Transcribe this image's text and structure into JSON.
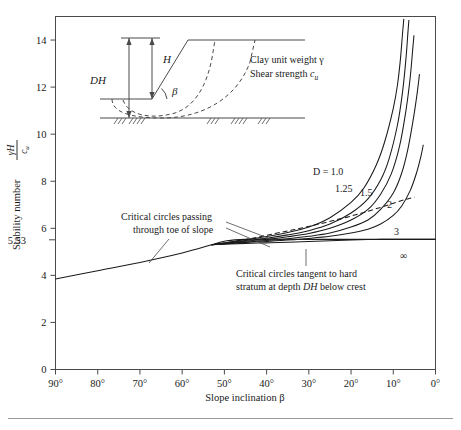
{
  "figure": {
    "domain": "chart",
    "background": "#ffffff",
    "line_color": "#1a1a1a",
    "axis_color": "#4a4a4a"
  },
  "chart_data": {
    "type": "line",
    "title": "",
    "xlabel": "Slope inclination β",
    "ylabel_text": "Stability number",
    "ylabel_fraction": {
      "numerator": "γH",
      "denominator": "cᵤ"
    },
    "xlim": [
      90,
      0
    ],
    "ylim": [
      0,
      15
    ],
    "x_ticks": [
      "90°",
      "80°",
      "70°",
      "60°",
      "50°",
      "40°",
      "30°",
      "20°",
      "10°",
      "0°"
    ],
    "x_tick_values": [
      90,
      80,
      70,
      60,
      50,
      40,
      30,
      20,
      10,
      0
    ],
    "y_ticks": [
      "0",
      "2",
      "4",
      "6",
      "8",
      "10",
      "12",
      "14"
    ],
    "y_tick_values": [
      0,
      2,
      4,
      6,
      8,
      10,
      12,
      14
    ],
    "special_y_tick": {
      "label": "5.53",
      "value": 5.53
    },
    "grid": false,
    "legend_position": "inline-curve-labels",
    "x_axis_direction": "reversed",
    "series": [
      {
        "name": "toe-circle-line",
        "label": "",
        "style": "solid",
        "note": "Critical circles passing through toe of slope",
        "points": [
          [
            90,
            3.85
          ],
          [
            80,
            4.2
          ],
          [
            70,
            4.55
          ],
          [
            60,
            4.95
          ],
          [
            53,
            5.3
          ],
          [
            50,
            5.45
          ],
          [
            45,
            5.53
          ],
          [
            30,
            5.53
          ],
          [
            15,
            5.53
          ],
          [
            0,
            5.53
          ]
        ]
      },
      {
        "name": "D-1.0",
        "label": "D = 1.0",
        "style": "solid",
        "points": [
          [
            53,
            5.3
          ],
          [
            45,
            5.52
          ],
          [
            40,
            5.65
          ],
          [
            35,
            5.82
          ],
          [
            30,
            6.05
          ],
          [
            25,
            6.45
          ],
          [
            20,
            7.1
          ],
          [
            17,
            7.7
          ],
          [
            14,
            8.7
          ],
          [
            12,
            9.7
          ],
          [
            10,
            11.1
          ],
          [
            9,
            12.1
          ],
          [
            8.3,
            13.2
          ],
          [
            7.8,
            14.3
          ],
          [
            7.5,
            14.9
          ]
        ]
      },
      {
        "name": "D-1.25",
        "label": "1.25",
        "style": "solid",
        "points": [
          [
            53,
            5.3
          ],
          [
            45,
            5.48
          ],
          [
            40,
            5.58
          ],
          [
            35,
            5.72
          ],
          [
            30,
            5.9
          ],
          [
            25,
            6.18
          ],
          [
            20,
            6.65
          ],
          [
            16,
            7.25
          ],
          [
            13,
            8.05
          ],
          [
            11,
            8.95
          ],
          [
            9,
            10.4
          ],
          [
            7.8,
            11.8
          ],
          [
            7,
            13.2
          ],
          [
            6.5,
            14.4
          ],
          [
            6.3,
            14.85
          ]
        ]
      },
      {
        "name": "D-1.5",
        "label": "1.5",
        "style": "solid",
        "points": [
          [
            53,
            5.3
          ],
          [
            45,
            5.45
          ],
          [
            40,
            5.53
          ],
          [
            35,
            5.64
          ],
          [
            30,
            5.78
          ],
          [
            25,
            6.0
          ],
          [
            20,
            6.35
          ],
          [
            16,
            6.8
          ],
          [
            13,
            7.45
          ],
          [
            10.5,
            8.3
          ],
          [
            8.5,
            9.5
          ],
          [
            7,
            11.0
          ],
          [
            6,
            12.4
          ],
          [
            5.4,
            13.6
          ],
          [
            5.1,
            14.2
          ]
        ]
      },
      {
        "name": "D-2",
        "label": "2",
        "style": "solid",
        "points": [
          [
            53,
            5.3
          ],
          [
            45,
            5.42
          ],
          [
            40,
            5.48
          ],
          [
            35,
            5.56
          ],
          [
            30,
            5.66
          ],
          [
            25,
            5.8
          ],
          [
            20,
            6.05
          ],
          [
            16,
            6.35
          ],
          [
            13,
            6.8
          ],
          [
            10,
            7.5
          ],
          [
            8,
            8.35
          ],
          [
            6.5,
            9.4
          ],
          [
            5.2,
            10.7
          ],
          [
            4.3,
            11.8
          ],
          [
            3.8,
            12.55
          ]
        ]
      },
      {
        "name": "D-3",
        "label": "3",
        "style": "solid",
        "points": [
          [
            53,
            5.3
          ],
          [
            45,
            5.4
          ],
          [
            40,
            5.44
          ],
          [
            35,
            5.5
          ],
          [
            30,
            5.57
          ],
          [
            25,
            5.66
          ],
          [
            20,
            5.8
          ],
          [
            16,
            5.96
          ],
          [
            13,
            6.18
          ],
          [
            10,
            6.55
          ],
          [
            8,
            6.95
          ],
          [
            6,
            7.6
          ],
          [
            4.5,
            8.35
          ],
          [
            3.4,
            9.1
          ],
          [
            2.9,
            9.55
          ]
        ]
      },
      {
        "name": "D-infinity",
        "label": "∞",
        "style": "solid",
        "points": [
          [
            53,
            5.3
          ],
          [
            45,
            5.36
          ],
          [
            40,
            5.38
          ],
          [
            35,
            5.41
          ],
          [
            30,
            5.44
          ],
          [
            25,
            5.47
          ],
          [
            20,
            5.5
          ],
          [
            16,
            5.52
          ],
          [
            13,
            5.53
          ],
          [
            10,
            5.53
          ],
          [
            6,
            5.53
          ],
          [
            2,
            5.53
          ],
          [
            0,
            5.53
          ]
        ]
      },
      {
        "name": "transition-dashed",
        "label": "",
        "style": "dashed",
        "note": "locus separating toe circles from deep circles",
        "points": [
          [
            53,
            5.3
          ],
          [
            45,
            5.52
          ],
          [
            38,
            5.78
          ],
          [
            32,
            6.0
          ],
          [
            26,
            6.25
          ],
          [
            20,
            6.52
          ],
          [
            15,
            6.78
          ],
          [
            11,
            7.0
          ],
          [
            8,
            7.18
          ],
          [
            6,
            7.28
          ],
          [
            5,
            7.32
          ]
        ]
      }
    ],
    "annotations": [
      {
        "name": "toe-annotation",
        "lines": [
          "Critical circles passing",
          "through toe of slope"
        ],
        "anchor_x": 40,
        "anchor_y": 5.6
      },
      {
        "name": "hard-stratum-annotation",
        "lines": [
          "Critical circles tangent to hard",
          "stratum at depth DH below crest"
        ],
        "anchor_x": 14,
        "anchor_y": 5.5
      },
      {
        "name": "material-note",
        "lines": [
          "Clay unit weight γ",
          "Shear strength cᵤ"
        ]
      }
    ],
    "curve_labels": [
      {
        "text": "D = 1.0",
        "series": "D-1.0"
      },
      {
        "text": "1.25",
        "series": "D-1.25"
      },
      {
        "text": "1.5",
        "series": "D-1.5"
      },
      {
        "text": "2",
        "series": "D-2"
      },
      {
        "text": "3",
        "series": "D-3"
      },
      {
        "text": "∞",
        "series": "D-infinity"
      }
    ]
  },
  "inset": {
    "name": "slope-geometry-diagram",
    "labels": {
      "depth_total": "DH",
      "slope_height": "H",
      "angle": "β"
    },
    "material_line_1": "Clay unit weight γ",
    "material_line_2_pre": "Shear strength ",
    "material_line_2_sym": "c",
    "material_line_2_sub": "u"
  },
  "annotation_text": {
    "toe_line1": "Critical circles passing",
    "toe_line2": "through toe of slope",
    "hard_line1": "Critical circles tangent to hard",
    "hard_line2_pre": "stratum at depth ",
    "hard_line2_em": "DH",
    "hard_line2_post": " below crest",
    "five_five_three": "5.53"
  },
  "axis_titles": {
    "x": "Slope inclination β",
    "y_prefix": "Stability number",
    "y_num": "γH",
    "y_den": "c",
    "y_den_sub": "u"
  }
}
